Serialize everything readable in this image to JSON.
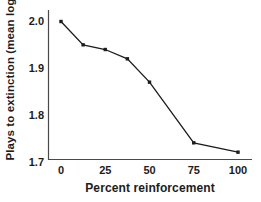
{
  "chart_data": {
    "type": "line",
    "title": "",
    "xlabel": "Percent reinforcement",
    "ylabel": "Plays to extinction (mean log)",
    "x": [
      0,
      12.5,
      25,
      37.5,
      50,
      75,
      100
    ],
    "y": [
      2.0,
      1.95,
      1.94,
      1.92,
      1.87,
      1.74,
      1.72
    ],
    "series_name": "Plays to extinction",
    "xticks": [
      0,
      25,
      50,
      75,
      100
    ],
    "xtick_labels": [
      "0",
      "25",
      "50",
      "75",
      "100"
    ],
    "yticks": [
      2.0,
      1.9,
      1.8,
      1.7
    ],
    "ytick_labels": [
      "2.0",
      "1.9",
      "1.8",
      "1.7"
    ],
    "xlim": [
      -7,
      108
    ],
    "ylim": [
      1.7,
      2.02
    ],
    "grid": false,
    "legend": "none",
    "marker": "square",
    "line_color": "#1c1c1c",
    "axis_color": "#4a4a4a",
    "background_color": "#ffffff"
  }
}
